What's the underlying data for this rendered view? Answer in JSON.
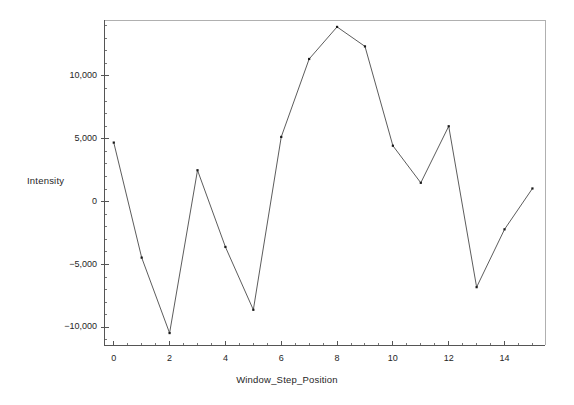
{
  "chart_data": {
    "type": "line",
    "title": "",
    "xlabel": "Window_Step_Position",
    "ylabel": "Intensity",
    "x": [
      0,
      1,
      2,
      3,
      4,
      5,
      6,
      7,
      8,
      9,
      10,
      11,
      12,
      13,
      14,
      15
    ],
    "values": [
      4700,
      -4450,
      -10450,
      2500,
      -3600,
      -8600,
      5150,
      11350,
      13900,
      12350,
      4450,
      1500,
      6000,
      -6800,
      -2200,
      1050
    ],
    "series": [
      {
        "name": "Intensity",
        "values": [
          4700,
          -4450,
          -10450,
          2500,
          -3600,
          -8600,
          5150,
          11350,
          13900,
          12350,
          4450,
          1500,
          6000,
          -6800,
          -2200,
          1050
        ]
      }
    ],
    "xlim": [
      -0.35,
      15.45
    ],
    "ylim": [
      -11400,
      14450
    ],
    "xticks": [
      0,
      2,
      4,
      6,
      8,
      10,
      12,
      14
    ],
    "xticklabels": [
      "0",
      "2",
      "4",
      "6",
      "8",
      "10",
      "12",
      "14"
    ],
    "x_minor_tick_step": 0.5,
    "yticks": [
      -10000,
      -5000,
      0,
      5000,
      10000
    ],
    "yticklabels": [
      "−10,000",
      "−5,000",
      "0",
      "5,000",
      "10,000"
    ],
    "y_minor_tick_step": 1000,
    "grid": false,
    "legend": false,
    "marker": "square",
    "marker_size": 2.2,
    "line_color": "#4a4a4a",
    "marker_color": "#1a1a1a",
    "frame_color": "#b0b0b0",
    "axis_color": "#555555",
    "background": "#ffffff"
  },
  "geometry": {
    "plot_left": 104,
    "plot_right": 545,
    "plot_top": 20,
    "plot_bottom": 345
  }
}
